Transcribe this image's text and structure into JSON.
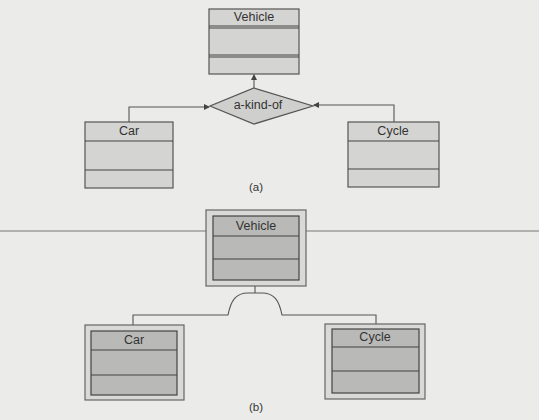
{
  "diagram_a": {
    "caption": "(a)",
    "parent_class": {
      "name": "Vehicle"
    },
    "relationship": {
      "label": "a-kind-of"
    },
    "child_classes": [
      {
        "name": "Car"
      },
      {
        "name": "Cycle"
      }
    ]
  },
  "diagram_b": {
    "caption": "(b)",
    "parent_class": {
      "name": "Vehicle"
    },
    "child_classes": [
      {
        "name": "Car"
      },
      {
        "name": "Cycle"
      }
    ]
  },
  "separator_line": {
    "color": "#777777"
  }
}
